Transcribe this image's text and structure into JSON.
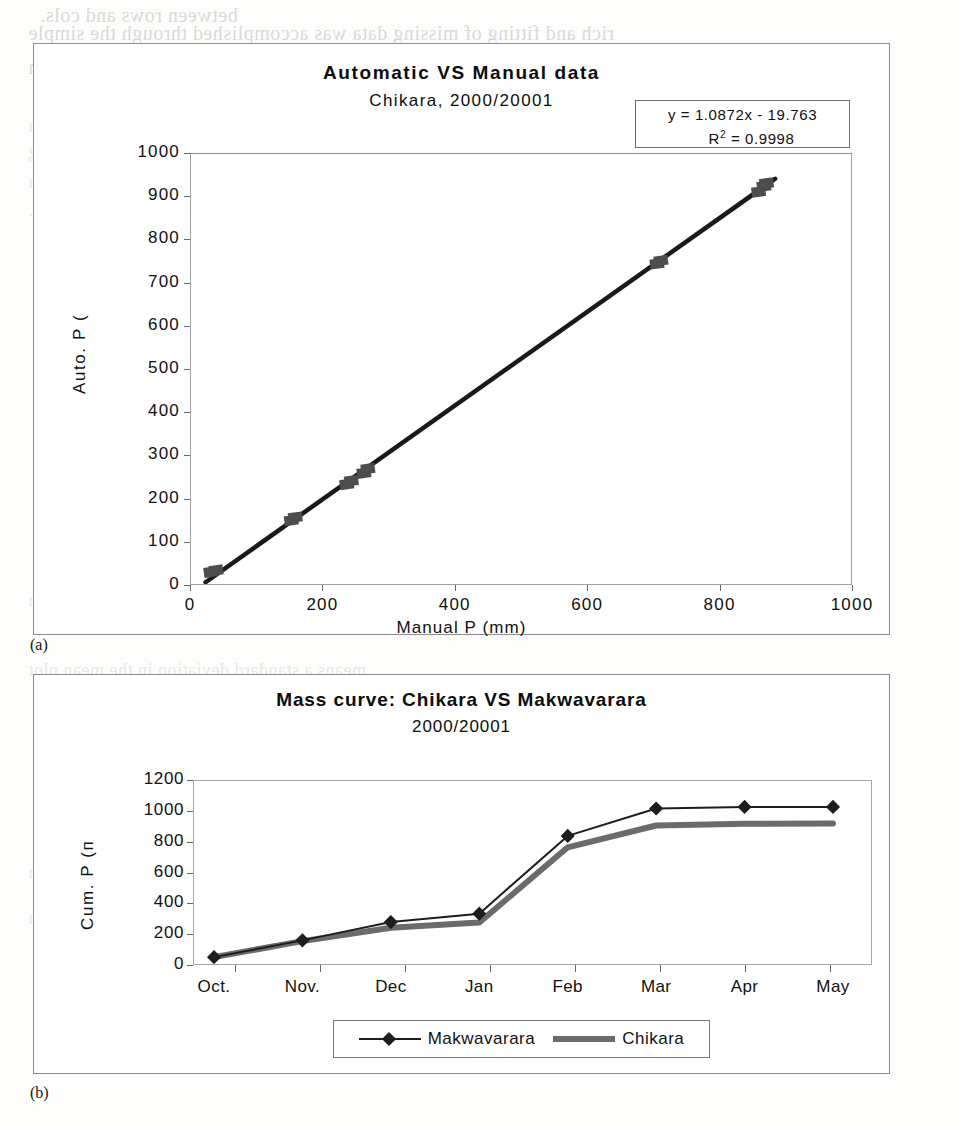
{
  "page": {
    "bleed_lines": [
      {
        "text": "between rows and cols.",
        "x": 40,
        "y": 4
      },
      {
        "text": "rich and fitting of missing data was accomplished through the simple",
        "x": 28,
        "y": 22
      },
      {
        "text": "regression",
        "x": 28,
        "y": 56
      },
      {
        "text": "means a standard and fluctuating double-mass analysis (Oshman & Nash",
        "x": 28,
        "y": 116
      },
      {
        "text": "It was of the prominent moisture values at given stations in the neighbouring",
        "x": 28,
        "y": 142
      },
      {
        "text": "region was obtained with the calculated mass plots. The Philips line research",
        "x": 28,
        "y": 172
      },
      {
        "text": "mass analysis then used to estimate the time of degree weather.",
        "x": 28,
        "y": 200
      },
      {
        "text": "and the sequence of the simple events will be used to estimate the region",
        "x": 28,
        "y": 590
      },
      {
        "text": "means a standard deviation in the mean plot",
        "x": 28,
        "y": 660
      },
      {
        "text": "and the known data series of the mass curves of the data and the region",
        "x": 28,
        "y": 862
      },
      {
        "text": "and the sequence of the mass analysis at the region",
        "x": 28,
        "y": 908
      }
    ],
    "panel_labels": [
      {
        "label": "(a)",
        "x": 30,
        "y": 636
      },
      {
        "label": "(b)",
        "x": 30,
        "y": 1084
      }
    ]
  },
  "chart_a": {
    "title": "Automatic VS Manual data",
    "subtitle": "Chikara, 2000/20001",
    "equation": "y = 1.0872x - 19.763",
    "r_squared_label": "R",
    "r_squared_sup": "2",
    "r_squared_value": "= 0.9998",
    "xlabel": "Manual P (mm)",
    "ylabel": "Auto. P (",
    "ytick_labels": [
      "1000",
      "900",
      "800",
      "700",
      "600",
      "500",
      "400",
      "300",
      "200",
      "100",
      "0"
    ],
    "xtick_labels": [
      "0",
      "200",
      "400",
      "600",
      "800",
      "1000"
    ]
  },
  "chart_b": {
    "title": "Mass curve: Chikara VS Makwavarara",
    "subtitle": "2000/20001",
    "ylabel": "Cum. P (п",
    "ytick_labels": [
      "1200",
      "1000",
      "800",
      "600",
      "400",
      "200",
      "0"
    ],
    "xtick_labels": [
      "Oct.",
      "Nov.",
      "Dec",
      "Jan",
      "Feb",
      "Mar",
      "Apr",
      "May"
    ],
    "legend": [
      {
        "name": "Makwavarara",
        "style": "thin-line-with-diamond-markers",
        "color": "#1d1d1d"
      },
      {
        "name": "Chikara",
        "style": "thick-line",
        "color": "#6b6b6b"
      }
    ]
  },
  "chart_data": [
    {
      "type": "scatter",
      "id": "chart-a",
      "title": "Automatic VS Manual data",
      "subtitle": "Chikara, 2000/20001",
      "xlabel": "Manual P (mm)",
      "ylabel": "Auto. P (mm)",
      "xlim": [
        0,
        1000
      ],
      "ylim": [
        0,
        1000
      ],
      "xticks": [
        0,
        200,
        400,
        600,
        800,
        1000
      ],
      "yticks": [
        0,
        100,
        200,
        300,
        400,
        500,
        600,
        700,
        800,
        900,
        1000
      ],
      "grid": false,
      "legend": "none",
      "marker": "filled-diamond",
      "marker_color": "#4a4a4a",
      "points": [
        {
          "x": 30,
          "y": 28
        },
        {
          "x": 38,
          "y": 32
        },
        {
          "x": 152,
          "y": 148
        },
        {
          "x": 158,
          "y": 155
        },
        {
          "x": 236,
          "y": 232
        },
        {
          "x": 243,
          "y": 240
        },
        {
          "x": 262,
          "y": 258
        },
        {
          "x": 268,
          "y": 268
        },
        {
          "x": 706,
          "y": 745
        },
        {
          "x": 712,
          "y": 752
        },
        {
          "x": 860,
          "y": 912
        },
        {
          "x": 868,
          "y": 925
        },
        {
          "x": 872,
          "y": 932
        }
      ],
      "trendline": {
        "equation": "y = 1.0872x - 19.763",
        "slope": 1.0872,
        "intercept": -19.763,
        "r_squared": 0.9998,
        "color": "#1a1a1a"
      },
      "annotations": [
        "y = 1.0872x - 19.763",
        "R² = 0.9998"
      ]
    },
    {
      "type": "line",
      "id": "chart-b",
      "title": "Mass curve: Chikara VS Makwavarara",
      "subtitle": "2000/20001",
      "xlabel": "",
      "ylabel": "Cum. P (mm)",
      "categories": [
        "Oct.",
        "Nov.",
        "Dec",
        "Jan",
        "Feb",
        "Mar",
        "Apr",
        "May"
      ],
      "ylim": [
        0,
        1200
      ],
      "yticks": [
        0,
        200,
        400,
        600,
        800,
        1000,
        1200
      ],
      "grid": false,
      "legend_position": "bottom",
      "series": [
        {
          "name": "Makwavarara",
          "color": "#1d1d1d",
          "marker": "filled-diamond",
          "linewidth": 2,
          "values": [
            45,
            155,
            275,
            330,
            840,
            1020,
            1030,
            1030
          ]
        },
        {
          "name": "Chikara",
          "color": "#6b6b6b",
          "marker": "none",
          "linewidth": 6,
          "values": [
            45,
            150,
            238,
            272,
            765,
            908,
            920,
            922
          ]
        }
      ]
    }
  ]
}
